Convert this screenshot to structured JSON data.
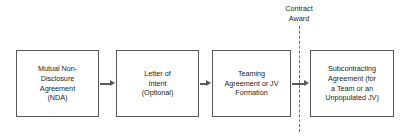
{
  "diagram": {
    "colors": {
      "box_border": "#58595b",
      "text": "#231f20",
      "arrow": "#58595b",
      "milestone_line": "#6d6e71",
      "background": "#ffffff"
    },
    "boxes": [
      {
        "id": "nda",
        "label": "Mutual Non-\nDisclosure\nAgreement\n(NDA)",
        "order": 1
      },
      {
        "id": "letter-of-intent",
        "label": "Letter of\nIntent\n(Optional)",
        "order": 2
      },
      {
        "id": "teaming-agreement",
        "label": "Teaming\nAgreement or JV\nFormation",
        "order": 3
      },
      {
        "id": "subcontracting-agreement",
        "label": "Subcontracting\nAgreement (for\na Team or an\nUnpopulated JV)",
        "order": 4
      }
    ],
    "milestone": {
      "label": "Contract\nAward",
      "style": "vertical-dashed-line"
    },
    "connectors": [
      {
        "id": "nda-to-loi",
        "icon": "arrow-right-icon"
      },
      {
        "id": "loi-to-teaming",
        "icon": "arrow-right-icon"
      },
      {
        "id": "teaming-to-subk",
        "icon": "arrow-right-icon"
      }
    ]
  }
}
